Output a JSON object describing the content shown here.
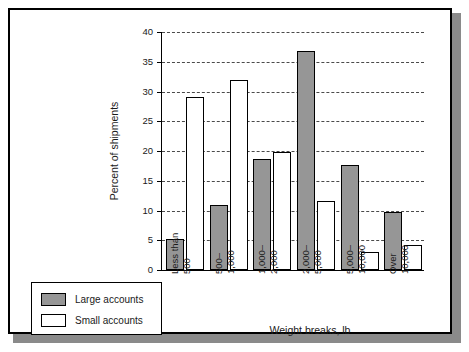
{
  "chart_data": {
    "type": "bar",
    "title": "",
    "xlabel": "Weight breaks, lb",
    "ylabel": "Percent of shipments",
    "ylim": [
      0,
      40
    ],
    "yticks": [
      0,
      5,
      10,
      15,
      20,
      25,
      30,
      35,
      40
    ],
    "ytick_labels": [
      "0",
      "5",
      "10",
      "15",
      "20",
      "25",
      "30",
      "35",
      "40"
    ],
    "grid": "horizontal-dashed",
    "legend_position": "bottom-left-outside",
    "categories": [
      {
        "line1": "Less than",
        "line2": "500"
      },
      {
        "line1": "500–",
        "line2": "1,000"
      },
      {
        "line1": "1,000–",
        "line2": "2,000"
      },
      {
        "line1": "2,000–",
        "line2": "5,000"
      },
      {
        "line1": "5,000–",
        "line2": "10,000"
      },
      {
        "line1": "Over",
        "line2": "10,000"
      }
    ],
    "series": [
      {
        "name": "Large accounts",
        "color": "#969696",
        "values": [
          5.2,
          11.0,
          18.6,
          36.8,
          17.6,
          9.8
        ]
      },
      {
        "name": "Small accounts",
        "color": "#ffffff",
        "values": [
          29.0,
          31.9,
          19.9,
          11.6,
          3.0,
          4.2
        ]
      }
    ]
  },
  "legend": {
    "items": [
      {
        "label": "Large accounts",
        "swatch": "large"
      },
      {
        "label": "Small accounts",
        "swatch": "small"
      }
    ]
  },
  "colors": {
    "large_accounts": "#969696",
    "small_accounts": "#ffffff",
    "outline": "#000000",
    "gridline": "#4a4a4a",
    "frame": "#000000",
    "shadow": "#8a8a8a"
  }
}
